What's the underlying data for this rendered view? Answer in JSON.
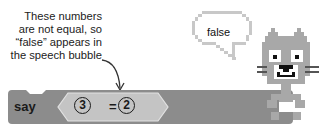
{
  "annotation": {
    "lines": [
      "These numbers",
      "are not equal, so",
      "“false” appears in",
      "the speech bubble"
    ]
  },
  "block": {
    "say_label": "say",
    "left_value": "3",
    "operator": "=",
    "right_value": "2"
  },
  "speech_bubble": {
    "text": "false"
  },
  "colors": {
    "block_dark": "#8c8c8c",
    "block_light": "#c4c4c4",
    "cat_gray": "#a8a8a8",
    "cat_dark": "#555555"
  }
}
